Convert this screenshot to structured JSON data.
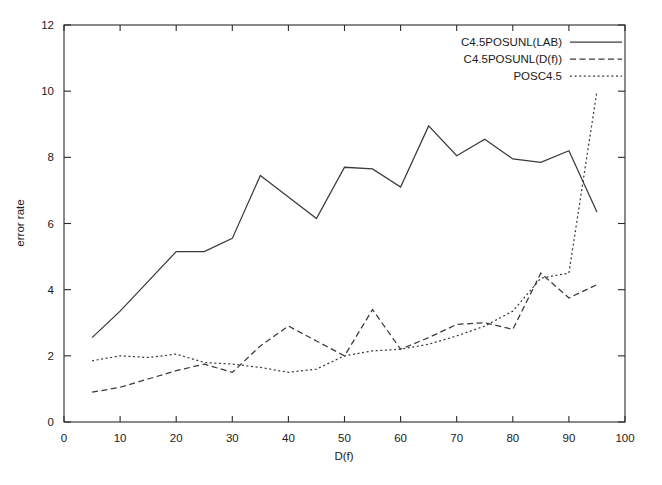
{
  "chart_data": {
    "type": "line",
    "title": "",
    "xlabel": "D(f)",
    "ylabel": "error rate",
    "xlim": [
      0,
      100
    ],
    "ylim": [
      0,
      12
    ],
    "xticks": [
      0,
      10,
      20,
      30,
      40,
      50,
      60,
      70,
      80,
      90,
      100
    ],
    "xtick_labels": [
      "0",
      "10",
      "20",
      "30",
      "40",
      "50",
      "60",
      "70",
      "80",
      "90",
      "100"
    ],
    "yticks": [
      0,
      2,
      4,
      6,
      8,
      10,
      12
    ],
    "ytick_labels": [
      "0",
      "2",
      "4",
      "6",
      "8",
      "10",
      "12"
    ],
    "grid": false,
    "legend_position": "top-right",
    "x": [
      5,
      10,
      15,
      20,
      25,
      30,
      35,
      40,
      45,
      50,
      55,
      60,
      65,
      70,
      75,
      80,
      85,
      90,
      95
    ],
    "series": [
      {
        "name": "C4.5POSUNL(LAB)",
        "style": "solid",
        "color": "#3a3a3a",
        "values": [
          2.55,
          3.35,
          4.25,
          5.15,
          5.15,
          5.55,
          7.45,
          6.8,
          6.15,
          7.7,
          7.65,
          7.1,
          8.95,
          8.05,
          8.55,
          7.95,
          7.85,
          8.2,
          6.35
        ]
      },
      {
        "name": "C4.5POSUNL(D(f))",
        "style": "dashed",
        "color": "#3a3a3a",
        "values": [
          0.9,
          1.05,
          1.3,
          1.55,
          1.75,
          1.5,
          2.3,
          2.9,
          2.45,
          2.0,
          3.4,
          2.2,
          2.55,
          2.95,
          3.0,
          2.8,
          4.5,
          3.75,
          4.15
        ]
      },
      {
        "name": "POSC4.5",
        "style": "dotted",
        "color": "#3a3a3a",
        "values": [
          1.85,
          2.0,
          1.95,
          2.05,
          1.8,
          1.75,
          1.65,
          1.5,
          1.6,
          2.0,
          2.15,
          2.2,
          2.35,
          2.6,
          2.9,
          3.35,
          4.35,
          4.5,
          10.0
        ]
      }
    ]
  },
  "legend": {
    "entries": [
      {
        "label": "C4.5POSUNL(LAB)",
        "style": "solid"
      },
      {
        "label": "C4.5POSUNL(D(f))",
        "style": "dashed"
      },
      {
        "label": "POSC4.5",
        "style": "dotted"
      }
    ]
  }
}
